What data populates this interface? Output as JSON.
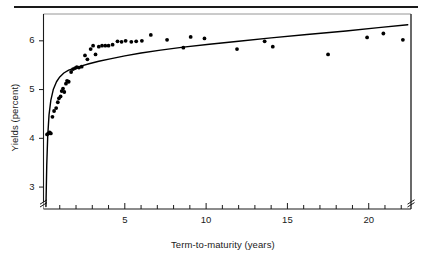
{
  "figure": {
    "name": "yield-curve-scatter-figure",
    "background": "#ffffff",
    "ink_color": "#1a1a1a"
  },
  "chart_data": {
    "type": "scatter",
    "title": "",
    "subtitle": "",
    "xlabel": "Term-to-maturity (years)",
    "ylabel": "Yields (percent)",
    "xlim": [
      0,
      22.6
    ],
    "ylim": [
      2.55,
      6.55
    ],
    "grid": false,
    "legend": null,
    "axis_break_y": true,
    "axis_break_x_right": true,
    "xticks_major": [
      5,
      10,
      15,
      20
    ],
    "xticks_minor": [
      1,
      2,
      3,
      4,
      6,
      7,
      8,
      9,
      11,
      12,
      13,
      14,
      16,
      17,
      18,
      19,
      21,
      22
    ],
    "xtick_labels": [
      "5",
      "10",
      "15",
      "20"
    ],
    "yticks": [
      3,
      4,
      5,
      6
    ],
    "ytick_labels": [
      "3",
      "4",
      "5",
      "6"
    ],
    "series": [
      {
        "name": "observed yields",
        "type": "scatter",
        "marker": "filled-circle",
        "color": "#000000",
        "points": [
          [
            0.22,
            4.08
          ],
          [
            0.3,
            4.1
          ],
          [
            0.38,
            4.12
          ],
          [
            0.45,
            4.1
          ],
          [
            0.55,
            4.44
          ],
          [
            0.65,
            4.56
          ],
          [
            0.78,
            4.62
          ],
          [
            0.88,
            4.74
          ],
          [
            0.95,
            4.82
          ],
          [
            1.05,
            4.86
          ],
          [
            1.12,
            4.97
          ],
          [
            1.2,
            5.02
          ],
          [
            1.28,
            4.95
          ],
          [
            1.38,
            5.12
          ],
          [
            1.45,
            5.18
          ],
          [
            1.55,
            5.16
          ],
          [
            1.7,
            5.36
          ],
          [
            1.82,
            5.42
          ],
          [
            1.95,
            5.44
          ],
          [
            2.05,
            5.46
          ],
          [
            2.18,
            5.45
          ],
          [
            2.35,
            5.47
          ],
          [
            2.55,
            5.7
          ],
          [
            2.7,
            5.62
          ],
          [
            2.9,
            5.83
          ],
          [
            3.05,
            5.9
          ],
          [
            3.2,
            5.72
          ],
          [
            3.4,
            5.88
          ],
          [
            3.6,
            5.9
          ],
          [
            3.8,
            5.9
          ],
          [
            4.0,
            5.9
          ],
          [
            4.25,
            5.92
          ],
          [
            4.55,
            5.99
          ],
          [
            4.8,
            5.98
          ],
          [
            5.05,
            6.0
          ],
          [
            5.4,
            5.98
          ],
          [
            5.7,
            5.99
          ],
          [
            6.05,
            6.0
          ],
          [
            6.6,
            6.12
          ],
          [
            7.6,
            6.02
          ],
          [
            8.6,
            5.86
          ],
          [
            9.05,
            6.08
          ],
          [
            9.9,
            6.05
          ],
          [
            11.9,
            5.83
          ],
          [
            13.6,
            5.99
          ],
          [
            14.1,
            5.88
          ],
          [
            17.5,
            5.72
          ],
          [
            19.9,
            6.07
          ],
          [
            20.9,
            6.15
          ],
          [
            22.1,
            6.02
          ]
        ]
      },
      {
        "name": "fitted curve",
        "type": "line",
        "color": "#000000",
        "description": "smooth concave fitted yield curve rising from low short maturities and flattening at long maturities",
        "points": [
          [
            0.15,
            2.6
          ],
          [
            0.2,
            3.45
          ],
          [
            0.26,
            4.05
          ],
          [
            0.34,
            4.48
          ],
          [
            0.45,
            4.78
          ],
          [
            0.6,
            5.0
          ],
          [
            0.8,
            5.16
          ],
          [
            1.0,
            5.26
          ],
          [
            1.25,
            5.34
          ],
          [
            1.55,
            5.4
          ],
          [
            1.9,
            5.44
          ],
          [
            2.3,
            5.48
          ],
          [
            2.8,
            5.53
          ],
          [
            3.4,
            5.58
          ],
          [
            4.1,
            5.63
          ],
          [
            5.0,
            5.69
          ],
          [
            6.0,
            5.75
          ],
          [
            7.2,
            5.81
          ],
          [
            8.6,
            5.87
          ],
          [
            10.2,
            5.93
          ],
          [
            12.0,
            5.99
          ],
          [
            14.0,
            6.06
          ],
          [
            16.2,
            6.13
          ],
          [
            18.6,
            6.2
          ],
          [
            20.6,
            6.27
          ],
          [
            22.4,
            6.33
          ]
        ]
      }
    ]
  }
}
